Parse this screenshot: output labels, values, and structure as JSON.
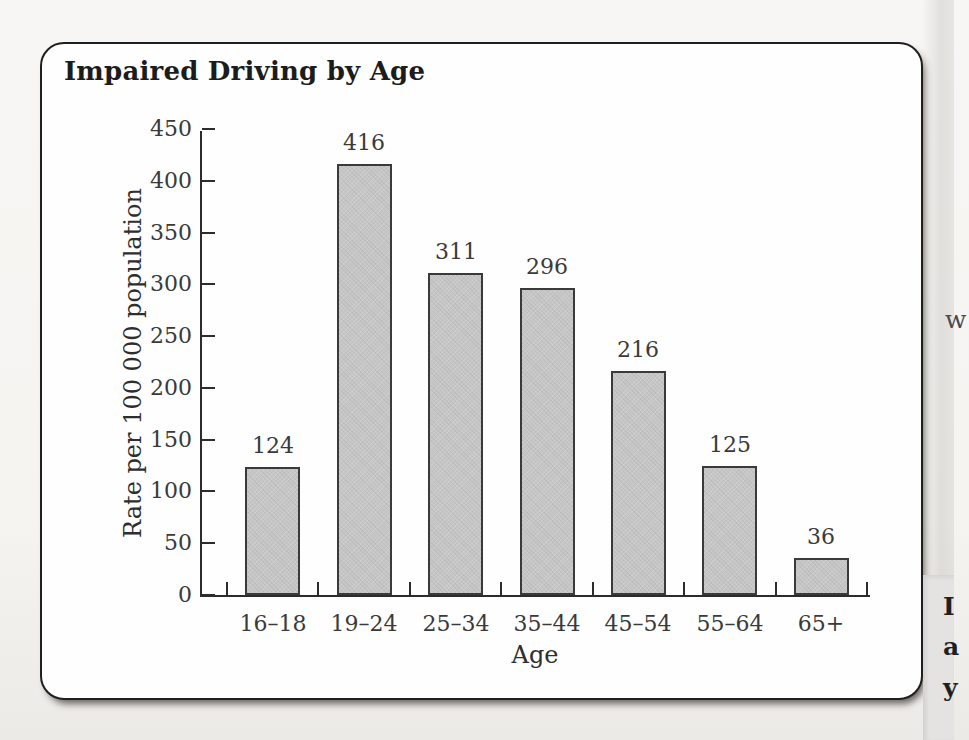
{
  "chart_data": {
    "type": "bar",
    "title": "Impaired Driving by Age",
    "categories": [
      "16–18",
      "19–24",
      "25–34",
      "35–44",
      "45–54",
      "55–64",
      "65+"
    ],
    "values": [
      124,
      416,
      311,
      296,
      216,
      125,
      36
    ],
    "value_labels": [
      "124",
      "416",
      "311",
      "296",
      "216",
      "125",
      "36"
    ],
    "xlabel": "Age",
    "ylabel": "Rate per 100 000 population",
    "ylim": [
      0,
      450
    ],
    "yticks": [
      0,
      50,
      100,
      150,
      200,
      250,
      300,
      350,
      400,
      450
    ],
    "grid": false,
    "legend": "none",
    "bar_fill": "#c6c6c6",
    "bar_border": "#3a3a3a",
    "axis_color": "#2c2c2c"
  },
  "page_margin": {
    "clipped_text_right": "w",
    "panel_letters": [
      "I",
      "a",
      "y"
    ]
  }
}
